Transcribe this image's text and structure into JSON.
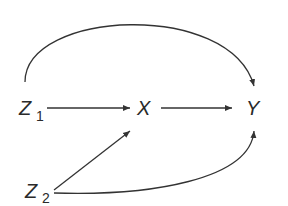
{
  "diagram": {
    "type": "causal-dag",
    "nodes": [
      {
        "id": "Z1",
        "label": "Z",
        "subscript": "1"
      },
      {
        "id": "X",
        "label": "X",
        "subscript": ""
      },
      {
        "id": "Y",
        "label": "Y",
        "subscript": ""
      },
      {
        "id": "Z2",
        "label": "Z",
        "subscript": "2"
      }
    ],
    "edges": [
      {
        "from": "Z1",
        "to": "Y",
        "shape": "arc-over"
      },
      {
        "from": "Z1",
        "to": "X",
        "shape": "straight"
      },
      {
        "from": "X",
        "to": "Y",
        "shape": "straight"
      },
      {
        "from": "Z2",
        "to": "X",
        "shape": "straight-diagonal"
      },
      {
        "from": "Z2",
        "to": "Y",
        "shape": "curve-under"
      }
    ],
    "colors": {
      "stroke": "#333333",
      "text": "#2a2a2a",
      "background": "#ffffff"
    }
  }
}
